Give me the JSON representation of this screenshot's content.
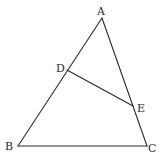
{
  "figure": {
    "type": "triangle-with-segment",
    "points": {
      "A": {
        "x": 102,
        "y": 18
      },
      "B": {
        "x": 18,
        "y": 146
      },
      "C": {
        "x": 147,
        "y": 146
      },
      "D": {
        "x": 67,
        "y": 70
      },
      "E": {
        "x": 133,
        "y": 106
      }
    },
    "labels": {
      "A": {
        "text": "A",
        "x": 97,
        "y": 15
      },
      "B": {
        "text": "B",
        "x": 5,
        "y": 150
      },
      "C": {
        "text": "C",
        "x": 148,
        "y": 152
      },
      "D": {
        "text": "D",
        "x": 56,
        "y": 72
      },
      "E": {
        "text": "E",
        "x": 137,
        "y": 112
      }
    },
    "segments": [
      {
        "from": "A",
        "to": "B"
      },
      {
        "from": "B",
        "to": "C"
      },
      {
        "from": "C",
        "to": "A"
      },
      {
        "from": "D",
        "to": "E"
      }
    ],
    "line_color": "#2a2a2a",
    "background": "#ffffff"
  }
}
